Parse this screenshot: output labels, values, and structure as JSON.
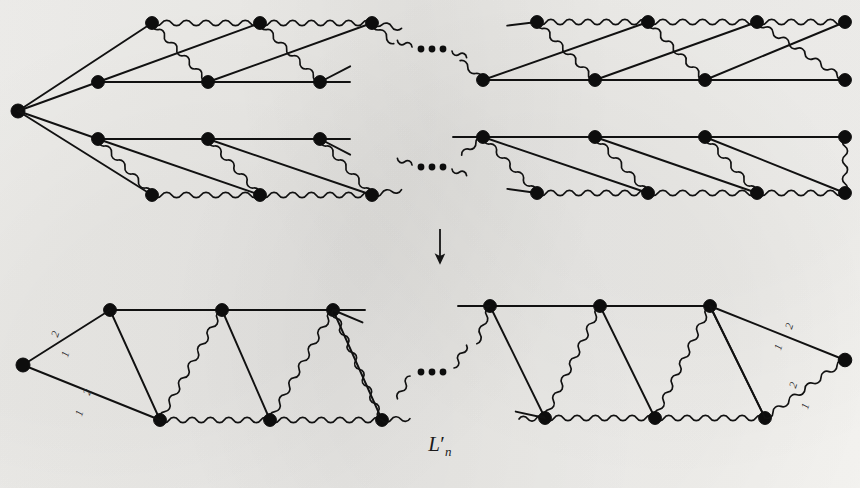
{
  "figure": {
    "name": "L",
    "name_prime": "′",
    "name_sub": "n",
    "caption_full": "L′n",
    "arrow_glyph": "↓",
    "ellipsis_glyph": "•••",
    "ink_color": "#111111",
    "paper_color": "#f2f1ee",
    "vertex_color": "#0d0d0d"
  },
  "edge_labels": {
    "two": "2",
    "one": "1"
  },
  "top_figure": {
    "title": "upper-graph",
    "apex": {
      "x": 18,
      "y": 111
    },
    "ladders": [
      {
        "id": "ladder-top-left",
        "top_row_y": 23,
        "bottom_row_y": 82,
        "top_x": [
          152,
          260,
          372
        ],
        "bottom_x": [
          98,
          208,
          320
        ],
        "top_edge_style": "wavy",
        "bottom_edge_style": "straight"
      },
      {
        "id": "ladder-top-right",
        "top_row_y": 22,
        "bottom_row_y": 80,
        "top_x": [
          537,
          648,
          757,
          845
        ],
        "bottom_x": [
          483,
          595,
          705,
          845
        ],
        "top_edge_style": "wavy",
        "bottom_edge_style": "straight"
      },
      {
        "id": "ladder-bottom-left",
        "top_row_y": 139,
        "bottom_row_y": 195,
        "top_x": [
          98,
          208,
          320
        ],
        "bottom_x": [
          152,
          260,
          372
        ],
        "top_edge_style": "straight",
        "bottom_edge_style": "wavy"
      },
      {
        "id": "ladder-bottom-right",
        "top_row_y": 137,
        "bottom_row_y": 193,
        "top_x": [
          483,
          595,
          705,
          845
        ],
        "bottom_x": [
          537,
          648,
          757,
          845
        ],
        "top_edge_style": "straight",
        "bottom_edge_style": "wavy"
      }
    ],
    "ellipses": [
      {
        "id": "ellipsis-top",
        "x": 432,
        "y": 49
      },
      {
        "id": "ellipsis-bottom",
        "x": 432,
        "y": 167
      }
    ]
  },
  "arrow": {
    "x": 440,
    "y": 245,
    "label": "maps-to"
  },
  "bottom_figure": {
    "title": "lower-graph",
    "left_apex": {
      "x": 23,
      "y": 365
    },
    "right_apex": {
      "x": 845,
      "y": 360
    },
    "left_ladder": {
      "id": "ladder-result-left",
      "top_row_y": 310,
      "bottom_row_y": 420,
      "top_x": [
        110,
        222,
        333
      ],
      "bottom_x": [
        160,
        270,
        382
      ],
      "top_edge_style": "straight",
      "bottom_edge_style": "wavy"
    },
    "right_ladder": {
      "id": "ladder-result-right",
      "top_row_y": 306,
      "bottom_row_y": 418,
      "top_x": [
        490,
        600,
        710
      ],
      "bottom_x": [
        545,
        655,
        765
      ],
      "top_edge_style": "straight",
      "bottom_edge_style": "wavy"
    },
    "ellipsis": {
      "id": "ellipsis-result",
      "x": 432,
      "y": 372
    },
    "labeled_edges": [
      {
        "id": "left-upper-edge",
        "weight_outer": "2",
        "weight_inner": "1"
      },
      {
        "id": "left-lower-edge",
        "weight_outer": "2",
        "weight_inner": "1"
      },
      {
        "id": "right-upper-edge",
        "weight_outer": "2",
        "weight_inner": "1"
      },
      {
        "id": "right-lower-edge",
        "weight_outer": "2",
        "weight_inner": "1"
      }
    ]
  }
}
